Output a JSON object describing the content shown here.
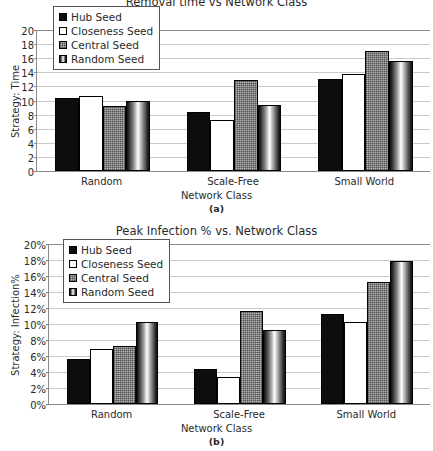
{
  "figure_a": {
    "caption": "(a)",
    "legend": [
      {
        "label": "Hub Seed",
        "swatch": "solid-black-square-icon"
      },
      {
        "label": "Closeness Seed",
        "swatch": "white-square-icon"
      },
      {
        "label": "Central Seed",
        "swatch": "gray-textured-square-icon"
      },
      {
        "label": "Random Seed",
        "swatch": "gradient-square-icon"
      }
    ],
    "chart_data": {
      "type": "bar",
      "title": "Removal time vs Network Class",
      "xlabel": "Network Class",
      "ylabel": "Strategy: Time",
      "categories": [
        "Random",
        "Scale-Free",
        "Small World"
      ],
      "series": [
        {
          "name": "Hub Seed",
          "values": [
            10.3,
            8.4,
            13.0
          ]
        },
        {
          "name": "Closeness Seed",
          "values": [
            10.6,
            7.3,
            13.7
          ]
        },
        {
          "name": "Central Seed",
          "values": [
            9.2,
            12.9,
            17.0
          ]
        },
        {
          "name": "Random Seed",
          "values": [
            10.0,
            9.4,
            15.6
          ]
        }
      ],
      "ylim": [
        0,
        20
      ],
      "ytick_step": 2,
      "yticks": [
        "0",
        "2",
        "4",
        "6",
        "8",
        "10",
        "12",
        "14",
        "16",
        "18",
        "20"
      ],
      "grid": true,
      "legend_position": "top-left-inside"
    }
  },
  "figure_b": {
    "caption": "(b)",
    "legend": [
      {
        "label": "Hub Seed",
        "swatch": "solid-black-square-icon"
      },
      {
        "label": "Closeness Seed",
        "swatch": "white-square-icon"
      },
      {
        "label": "Central Seed",
        "swatch": "gray-textured-square-icon"
      },
      {
        "label": "Random Seed",
        "swatch": "gradient-square-icon"
      }
    ],
    "chart_data": {
      "type": "bar",
      "title": "Peak Infection % vs. Network Class",
      "xlabel": "Network Class",
      "ylabel": "Strategy: Infection%",
      "categories": [
        "Random",
        "Scale-Free",
        "Small World"
      ],
      "series": [
        {
          "name": "Hub Seed",
          "values": [
            5.6,
            4.4,
            11.2
          ]
        },
        {
          "name": "Closeness Seed",
          "values": [
            6.9,
            3.4,
            10.2
          ]
        },
        {
          "name": "Central Seed",
          "values": [
            7.3,
            11.6,
            15.3
          ]
        },
        {
          "name": "Random Seed",
          "values": [
            10.3,
            9.3,
            17.9
          ]
        }
      ],
      "ylim": [
        0,
        20
      ],
      "ytick_step": 2,
      "yticks": [
        "0%",
        "2%",
        "4%",
        "6%",
        "8%",
        "10%",
        "12%",
        "14%",
        "16%",
        "18%",
        "20%"
      ],
      "grid": true,
      "legend_position": "top-left-inside"
    }
  }
}
